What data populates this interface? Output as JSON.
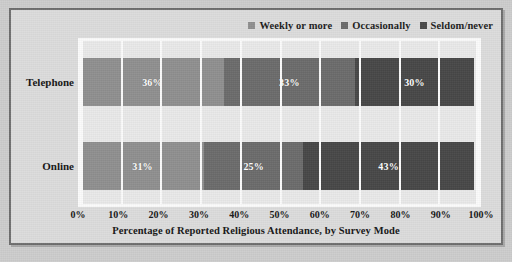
{
  "figure": {
    "frame_border_color": "#6e6e6e",
    "page_background": "#cdcdcd",
    "frame_background": "#dcdcdc",
    "plot_background": "#e9e9e9",
    "gridline_color": "#fbfbfb"
  },
  "chart_data": {
    "type": "bar",
    "orientation": "horizontal",
    "stacked": true,
    "title": "",
    "xlabel": "Percentage of Reported Religious Attendance, by Survey Mode",
    "ylabel": "",
    "categories": [
      "Telephone",
      "Online"
    ],
    "series": [
      {
        "name": "Weekly or more",
        "color": "#8f8f8f",
        "values": [
          36,
          33
        ]
      },
      {
        "name": "Occasionally",
        "color": "#6b6b6b",
        "values": [
          33,
          25
        ]
      },
      {
        "name": "Seldom/never",
        "color": "#474747",
        "values": [
          30,
          43
        ]
      }
    ],
    "rows": [
      {
        "category": "Telephone",
        "segments": [
          {
            "name": "Weekly or more",
            "value": 36,
            "label": "36%",
            "color": "#8f8f8f"
          },
          {
            "name": "Occasionally",
            "value": 33,
            "label": "33%",
            "color": "#6b6b6b"
          },
          {
            "name": "Seldom/never",
            "value": 30,
            "label": "30%",
            "color": "#474747"
          }
        ]
      },
      {
        "category": "Online",
        "segments": [
          {
            "name": "Weekly or more",
            "value": 31,
            "label": "31%",
            "color": "#8f8f8f"
          },
          {
            "name": "Occasionally",
            "value": 25,
            "label": "25%",
            "color": "#6b6b6b"
          },
          {
            "name": "Seldom/never",
            "value": 43,
            "label": "43%",
            "color": "#474747"
          }
        ]
      }
    ],
    "xlim": [
      0,
      100
    ],
    "xticks": [
      0,
      10,
      20,
      30,
      40,
      50,
      60,
      70,
      80,
      90,
      100
    ],
    "xticklabels": [
      "0%",
      "10%",
      "20%",
      "30%",
      "40%",
      "50%",
      "60%",
      "70%",
      "80%",
      "90%",
      "100%"
    ],
    "grid": true,
    "grid_axis": "x",
    "legend": {
      "position": "top-right",
      "entries": [
        {
          "label": "Weekly or more",
          "color": "#8f8f8f"
        },
        {
          "label": "Occasionally",
          "color": "#6b6b6b"
        },
        {
          "label": "Seldom/never",
          "color": "#474747"
        }
      ]
    }
  }
}
